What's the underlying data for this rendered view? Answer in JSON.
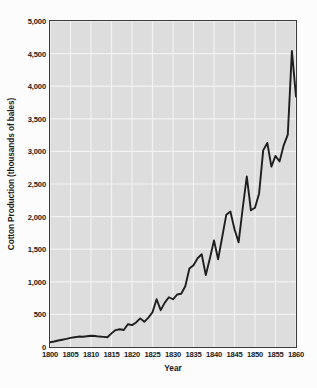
{
  "chart_data": {
    "type": "line",
    "title": "",
    "xlabel": "Year",
    "ylabel": "Cotton Production (thousands of bales)",
    "xlim": [
      1800,
      1860
    ],
    "ylim": [
      0,
      5000
    ],
    "grid": true,
    "legend": false,
    "xticks": [
      1800,
      1805,
      1810,
      1815,
      1820,
      1825,
      1830,
      1835,
      1840,
      1845,
      1850,
      1855,
      1860
    ],
    "xtick_labels": [
      "1800",
      "1805",
      "1810",
      "1815",
      "1820",
      "1825",
      "1830",
      "1835",
      "1840",
      "1845",
      "1850",
      "1855",
      "1860"
    ],
    "yticks": [
      0,
      500,
      1000,
      1500,
      2000,
      2500,
      3000,
      3500,
      4000,
      4500,
      5000
    ],
    "ytick_labels": [
      "0",
      "500",
      "1,000",
      "1,500",
      "2,000",
      "2,500",
      "3,000",
      "3,500",
      "4,000",
      "4,500",
      "5,000"
    ],
    "line_color": "#1e1e1e",
    "plot_background": "#dddddd",
    "gridline_color": "#f2f2f2",
    "x": [
      1800,
      1801,
      1802,
      1803,
      1804,
      1805,
      1806,
      1807,
      1808,
      1809,
      1810,
      1811,
      1812,
      1813,
      1814,
      1815,
      1816,
      1817,
      1818,
      1819,
      1820,
      1821,
      1822,
      1823,
      1824,
      1825,
      1826,
      1827,
      1828,
      1829,
      1830,
      1831,
      1832,
      1833,
      1834,
      1835,
      1836,
      1837,
      1838,
      1839,
      1840,
      1841,
      1842,
      1843,
      1844,
      1845,
      1846,
      1847,
      1848,
      1849,
      1850,
      1851,
      1852,
      1853,
      1854,
      1855,
      1856,
      1857,
      1858,
      1859,
      1860
    ],
    "y": [
      73,
      85,
      100,
      112,
      125,
      140,
      150,
      160,
      158,
      165,
      172,
      168,
      160,
      155,
      150,
      209,
      259,
      272,
      261,
      349,
      335,
      377,
      439,
      386,
      450,
      533,
      732,
      565,
      681,
      763,
      732,
      805,
      816,
      931,
      1205,
      1255,
      1361,
      1423,
      1102,
      1361,
      1635,
      1345,
      1684,
      2030,
      2078,
      1805,
      1606,
      2128,
      2615,
      2097,
      2136,
      2355,
      3016,
      3130,
      2766,
      2930,
      2847,
      3093,
      3258,
      4541,
      3841
    ]
  },
  "axis": {
    "y_title": "Cotton Production (thousands of bales)",
    "x_title": "Year"
  }
}
